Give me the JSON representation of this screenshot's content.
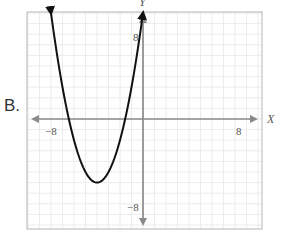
{
  "option": {
    "label": "B."
  },
  "chart_data": {
    "type": "line",
    "title": "",
    "xlabel": "X",
    "ylabel": "Y",
    "xlim": [
      -10,
      10
    ],
    "ylim": [
      -10,
      10
    ],
    "grid": true,
    "x_tick_labels": [
      {
        "value": -8,
        "label": "−8"
      },
      {
        "value": 8,
        "label": "8"
      }
    ],
    "y_tick_labels": [
      {
        "value": 8,
        "label": "8"
      },
      {
        "value": -8,
        "label": "−8"
      }
    ],
    "series": [
      {
        "name": "parabola",
        "equation": "y = (x + 4)^2 - 6",
        "vertex": [
          -4,
          -6
        ],
        "x_intercepts": [
          -6.45,
          -1.55
        ],
        "end_arrows": [
          [
            -8,
            10
          ],
          [
            0,
            10
          ]
        ],
        "x": [
          -8,
          -7,
          -6,
          -5,
          -4,
          -3,
          -2,
          -1,
          0
        ],
        "y": [
          10,
          3,
          -2,
          -5,
          -6,
          -5,
          -2,
          3,
          10
        ],
        "color": "#111111"
      }
    ]
  },
  "colors": {
    "axis": "#8a8a8a",
    "grid": "#ececec",
    "border": "#b5b5b5",
    "curve": "#111111"
  }
}
